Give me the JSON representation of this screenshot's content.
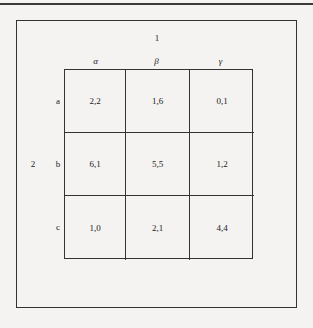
{
  "figure": {
    "type": "payoff-matrix",
    "players": {
      "column_player": "1",
      "row_player": "2"
    },
    "column_strategies": [
      "α",
      "β",
      "γ"
    ],
    "row_strategies": [
      "a",
      "b",
      "c"
    ],
    "payoffs": [
      [
        "2,2",
        "1,6",
        "0,1"
      ],
      [
        "6,1",
        "5,5",
        "1,2"
      ],
      [
        "1,0",
        "2,1",
        "4,4"
      ]
    ]
  }
}
